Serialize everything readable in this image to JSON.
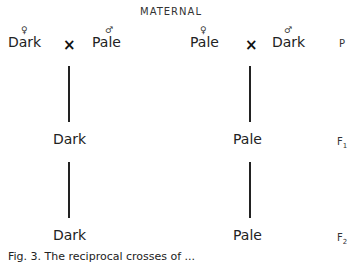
{
  "header": {
    "title": "MATERNAL"
  },
  "left_cross": {
    "female_symbol": "♀",
    "male_symbol": "♂",
    "female_parent": "Dark",
    "male_parent": "Pale",
    "cross_sign": "×",
    "f1": "Dark",
    "f2": "Dark"
  },
  "right_cross": {
    "female_symbol": "♀",
    "male_symbol": "♂",
    "female_parent": "Pale",
    "male_parent": "Dark",
    "cross_sign": "×",
    "f1": "Pale",
    "f2": "Pale"
  },
  "generations": {
    "p": "P",
    "f1_letter": "F",
    "f1_sub": "1",
    "f2_letter": "F",
    "f2_sub": "2"
  },
  "caption": {
    "text": "Fig. 3. The reciprocal crosses of ..."
  }
}
